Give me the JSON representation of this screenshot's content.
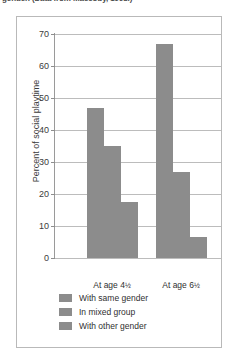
{
  "caption_sliver": "gender. (Data from Maccoby, 1998.)",
  "chart_data": {
    "type": "bar",
    "title": "",
    "xlabel": "",
    "ylabel": "Percent of social playtime",
    "ylim": [
      0,
      70
    ],
    "ytick_step": 10,
    "yticks": [
      70,
      60,
      50,
      40,
      30,
      20,
      10,
      0
    ],
    "ytick_labels": [
      "70",
      "60",
      "50",
      "40",
      "30",
      "20",
      "10",
      "0"
    ],
    "grid": true,
    "grid_axis": "y",
    "legend_position": "below-plot-left",
    "categories": [
      "At age 4½",
      "At age 6½"
    ],
    "category_labels": [
      {
        "prefix": "At age 4",
        "fraction": "½"
      },
      {
        "prefix": "At age 6",
        "fraction": "½"
      }
    ],
    "series": [
      {
        "name": "With same gender",
        "color": "#8c8c8c",
        "values": [
          47,
          67
        ]
      },
      {
        "name": "In mixed group",
        "color": "#8c8c8c",
        "values": [
          35,
          27
        ]
      },
      {
        "name": "With other gender",
        "color": "#8c8c8c",
        "values": [
          17.5,
          6.5
        ]
      }
    ]
  },
  "legend": {
    "items": [
      {
        "label": "With same gender",
        "color": "#8c8c8c"
      },
      {
        "label": "In mixed group",
        "color": "#8c8c8c"
      },
      {
        "label": "With other gender",
        "color": "#8c8c8c"
      }
    ]
  },
  "colors": {
    "bar": "#8c8c8c",
    "gridline": "#bcbcbc",
    "axis": "#9a9a9a",
    "frame": "#b9b9b9",
    "text": "#2f2f2f",
    "background": "#ffffff"
  }
}
